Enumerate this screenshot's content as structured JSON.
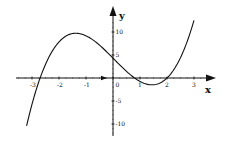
{
  "chart_data": {
    "type": "line",
    "title": "",
    "xlabel": "x",
    "ylabel": "y",
    "xlim": [
      -3.5,
      3.5
    ],
    "ylim": [
      -11,
      14
    ],
    "grid": false,
    "legend": null,
    "x_ticks": [
      -3,
      -2,
      -1,
      0,
      1,
      2,
      3
    ],
    "x_tick_labels": [
      "-3",
      "-2",
      "-1",
      "0",
      "1",
      "2",
      "3"
    ],
    "y_ticks": [
      10,
      5,
      -5,
      -10
    ],
    "y_tick_labels": [
      "10",
      "5",
      "-5",
      "-10"
    ],
    "series": [
      {
        "name": "f(x)",
        "description": "cubic curve, roots near x=-2.7, 0.8, 2; local max ~10 at x~-1.5; local min ~-1.5 at x~1.4; y-intercept ~4",
        "x": [
          -3.2,
          -3.0,
          -2.7,
          -2.5,
          -2.0,
          -1.5,
          -1.0,
          -0.5,
          0.0,
          0.5,
          0.8,
          1.0,
          1.4,
          1.8,
          2.0,
          2.5,
          3.0
        ],
        "y": [
          -10.4,
          -6.2,
          0.0,
          2.6,
          7.4,
          9.7,
          9.2,
          7.1,
          4.3,
          1.7,
          0.0,
          -0.8,
          -1.5,
          -0.9,
          0.0,
          3.3,
          12.5
        ]
      }
    ],
    "annotations": [
      {
        "type": "marker",
        "shape": "small-arrowhead",
        "x": -0.3,
        "y": 0
      }
    ]
  }
}
